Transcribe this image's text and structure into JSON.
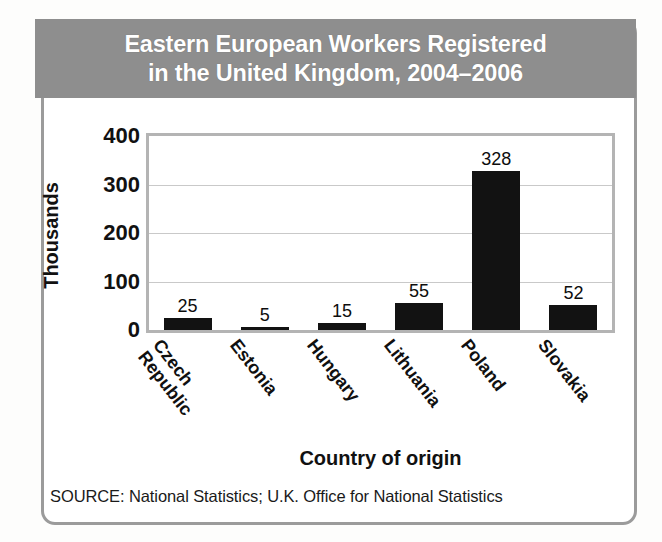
{
  "figure": {
    "title_line1": "Eastern European Workers Registered",
    "title_line2": "in the United Kingdom, 2004–2006",
    "title_full": "Eastern European Workers Registered in the United Kingdom, 2004–2006",
    "source_note": "SOURCE: National Statistics; U.K. Office for National Statistics",
    "colors": {
      "title_band": "#8e8e8e",
      "title_text": "#ffffff",
      "bar": "#121212",
      "card_border": "#9b9b9b",
      "plot_border": "#b4b4b4",
      "gridline": "#c9c9c9",
      "page_background": "#fdfdfc"
    }
  },
  "chart_data": {
    "type": "bar",
    "title": "Eastern European Workers Registered in the United Kingdom, 2004–2006",
    "subtitle": "",
    "categories": [
      "Czech Republic",
      "Estonia",
      "Hungary",
      "Lithuania",
      "Poland",
      "Slovakia"
    ],
    "category_lines": [
      [
        "Czech",
        "Republic"
      ],
      [
        "Estonia"
      ],
      [
        "Hungary"
      ],
      [
        "Lithuania"
      ],
      [
        "Poland"
      ],
      [
        "Slovakia"
      ]
    ],
    "values": [
      25,
      5,
      15,
      55,
      328,
      52
    ],
    "data_labels": [
      "25",
      "5",
      "15",
      "55",
      "328",
      "52"
    ],
    "xlabel": "Country of origin",
    "ylabel": "Thousands",
    "ylim": [
      0,
      400
    ],
    "yticks": [
      0,
      100,
      200,
      300,
      400
    ],
    "ytick_labels": [
      "0",
      "100",
      "200",
      "300",
      "400"
    ],
    "grid": "horizontal",
    "legend": "none",
    "units": "thousands of workers",
    "source": "SOURCE: National Statistics; U.K. Office for National Statistics"
  }
}
